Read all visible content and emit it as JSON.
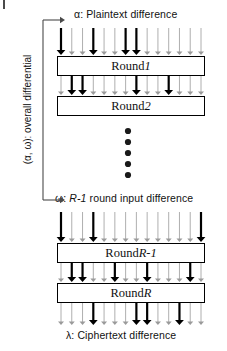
{
  "figure": {
    "type": "diagram",
    "background_color": "#ffffff",
    "line_color": "#000000",
    "thin_arrow_color": "#9a9a9a"
  },
  "labels": {
    "alpha": "α: Plaintext difference",
    "omega_prefix": "ω: ",
    "omega_italic": "R-1",
    "omega_suffix": " round input difference",
    "lambda": "λ: Ciphertext difference",
    "vertical_bracket": "(α, ω): overall differential"
  },
  "boxes": [
    {
      "prefix": "Round ",
      "italic": "1",
      "x": 57,
      "y": 56,
      "w": 148,
      "h": 20
    },
    {
      "prefix": "Round ",
      "italic": "2",
      "x": 57,
      "y": 96,
      "w": 148,
      "h": 20
    },
    {
      "prefix": "Round ",
      "italic": "R-1",
      "x": 57,
      "y": 243,
      "w": 148,
      "h": 20
    },
    {
      "prefix": "Round ",
      "italic": "R",
      "x": 57,
      "y": 283,
      "w": 148,
      "h": 20
    }
  ],
  "ellipsis": {
    "count": 5,
    "cx": 128,
    "start_y": 131,
    "spacing": 11,
    "radius": 3.1,
    "color": "#1a1a1a"
  },
  "bracket": {
    "x": 43,
    "top_y": 20,
    "bottom_y": 200,
    "arrow_len": 22,
    "color": "#4a4a4a"
  },
  "arrow_rows": [
    {
      "name": "plaintext-to-round-1",
      "y_top": 28,
      "y_bottom": 55,
      "count": 14,
      "bold_indices": [
        0,
        3,
        6,
        7
      ]
    },
    {
      "name": "round-1-to-round-2",
      "y_top": 76,
      "y_bottom": 95,
      "count": 14,
      "bold_indices": [
        1,
        2,
        7,
        10
      ]
    },
    {
      "name": "omega-to-round-r-minus-1",
      "y_top": 212,
      "y_bottom": 242,
      "count": 14,
      "bold_indices": [
        0,
        3,
        13
      ]
    },
    {
      "name": "round-r-minus-1-to-round-r",
      "y_top": 263,
      "y_bottom": 282,
      "count": 14,
      "bold_indices": [
        1,
        2,
        5,
        8,
        12
      ]
    },
    {
      "name": "round-r-to-ciphertext",
      "y_top": 303,
      "y_bottom": 325,
      "count": 14,
      "bold_indices": [
        3,
        7,
        8,
        11
      ]
    }
  ],
  "arrow_geometry": {
    "x_start": 61,
    "x_end": 201,
    "thin_width": 0.8,
    "bold_width": 2.2,
    "thin_head": 3.0,
    "bold_head": 4.4
  },
  "corner_marks": [
    {
      "name": "top-left-tick",
      "x": 3,
      "y": 1,
      "w": 1.5,
      "h": 9
    },
    {
      "name": "top-right-tick",
      "x": 220,
      "y": 1,
      "w": 1.5,
      "h": 9
    }
  ]
}
